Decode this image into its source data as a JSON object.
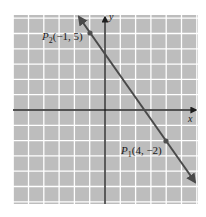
{
  "chart_data": {
    "type": "line",
    "title": "",
    "xlabel": "x",
    "ylabel": "y",
    "xlim": [
      -6,
      6
    ],
    "ylim": [
      -6,
      6
    ],
    "grid": true,
    "grid_step": 1,
    "series": [
      {
        "name": "line through P1 and P2",
        "slope": -1.4,
        "intercept": 3.6,
        "x": [
          -1.7,
          5.9
        ],
        "y": [
          6.0,
          -4.6
        ]
      }
    ],
    "points": [
      {
        "name": "P2",
        "label": "P2(−1, 5)",
        "x": -1,
        "y": 5
      },
      {
        "name": "P1",
        "label": "P1(4, −2)",
        "x": 4,
        "y": -2
      }
    ],
    "annotations": [
      {
        "text": "P2(−1, 5)",
        "near": "P2"
      },
      {
        "text": "P1(4, −2)",
        "near": "P1"
      }
    ]
  },
  "labels": {
    "x_axis": "x",
    "y_axis": "y",
    "p2": {
      "letter": "P",
      "sub": "2",
      "coords": "(−1, 5)"
    },
    "p1": {
      "letter": "P",
      "sub": "1",
      "coords": "(4, −2)"
    }
  },
  "colors": {
    "background": "#bdbdbd",
    "grid": "#ffffff",
    "axes": "#1e1e1e",
    "line": "#4a4a4a",
    "points": "#505050"
  }
}
